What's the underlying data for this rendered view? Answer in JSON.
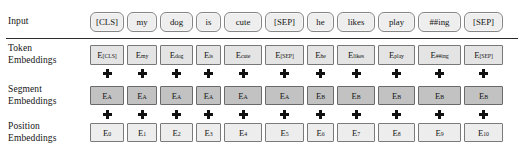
{
  "figure": {
    "sequence_length": 11,
    "colors": {
      "input_pill_fill": "#eeeeee",
      "token_fill": "#e4e4e4",
      "segment_fill": "#c2c2c2",
      "position_fill": "#ededed",
      "border": "#6d6d6d",
      "text": "#141414",
      "rule": "#2b2b2b"
    }
  },
  "rows": {
    "input": {
      "label_line1": "Input",
      "label_line2": "",
      "tokens": [
        "[CLS]",
        "my",
        "dog",
        "is",
        "cute",
        "[SEP]",
        "he",
        "likes",
        "play",
        "##ing",
        "[SEP]"
      ]
    },
    "token_embeddings": {
      "label_line1": "Token",
      "label_line2": "Embeddings",
      "symbol": "E",
      "subscripts": [
        "[CLS]",
        "my",
        "dog",
        "is",
        "cute",
        "[SEP]",
        "he",
        "likes",
        "play",
        "##ing",
        "[SEP]"
      ]
    },
    "segment_embeddings": {
      "label_line1": "Segment",
      "label_line2": "Embeddings",
      "symbol": "E",
      "subscripts": [
        "A",
        "A",
        "A",
        "A",
        "A",
        "A",
        "B",
        "B",
        "B",
        "B",
        "B"
      ]
    },
    "position_embeddings": {
      "label_line1": "Position",
      "label_line2": "Embeddings",
      "symbol": "E",
      "subscripts": [
        "0",
        "1",
        "2",
        "3",
        "4",
        "5",
        "6",
        "7",
        "8",
        "9",
        "10"
      ]
    }
  },
  "operators": {
    "plus": "+",
    "count_per_row": 11
  },
  "layout": {
    "cell_widths": [
      34,
      30,
      33,
      25,
      38,
      39,
      27,
      38,
      37,
      43,
      39
    ]
  }
}
